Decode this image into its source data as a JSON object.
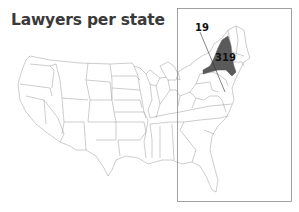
{
  "title": "Lawyers per state",
  "inset": {
    "region": "Northeast / East Coast",
    "highlighted_states": [
      {
        "state": "New York",
        "value": "319",
        "fill": "#5a5a5a"
      }
    ],
    "callouts": [
      {
        "label": "19",
        "target": "District of Columbia"
      }
    ]
  },
  "colors": {
    "highlight": "#5a5a5a",
    "outline": "#9a9a9a",
    "inset_border": "#8a8a8a",
    "title": "#3a3a3a"
  }
}
